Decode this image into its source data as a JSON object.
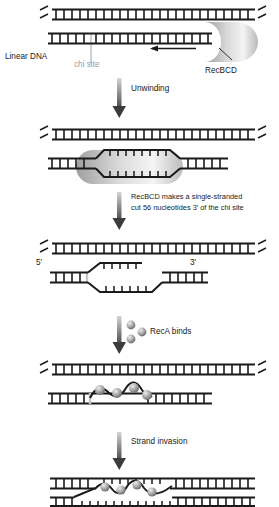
{
  "figure": {
    "background": "#ffffff",
    "width": 279,
    "height": 507
  },
  "colors": {
    "dna_stroke": "#1a1a1a",
    "chi_marker": "#b0b0b0",
    "label_text": "#1a1a1a",
    "label_text_gray": "#9a9a9a",
    "arrow": "#5a5a5a",
    "protein_fill_light": "#f2f2f2",
    "protein_fill_dark": "#8f8f8f",
    "reca_fill": "#9d9d9d"
  },
  "labels": {
    "linear_dna": "Linear DNA",
    "chi_site": "chi site",
    "recbcd": "RecBCD",
    "unwinding": "Unwinding",
    "cut_line1": "RecBCD makes a single-stranded",
    "cut_line2": "cut 56 nucleotides 3′ of the chi site",
    "five_prime": "5′",
    "three_prime": "3′",
    "reca_binds": "RecA binds",
    "strand_invasion": "Strand invasion"
  },
  "steps": [
    {
      "id": "step-1",
      "name": "linear-dna-with-recbcd",
      "caption": "Linear DNA with RecBCD bound at the right end; chi site marked; enzyme travels leftward"
    },
    {
      "id": "step-2",
      "name": "unwinding-bubble",
      "caption": "RecBCD unwinds the duplex creating a bubble of single-stranded DNA"
    },
    {
      "id": "step-3",
      "name": "single-stranded-cut",
      "caption": "Single-stranded cut made 56 nucleotides 3′ of the chi site; 5′ and 3′ ends indicated"
    },
    {
      "id": "step-4",
      "name": "reca-bound-filament",
      "caption": "RecA protein binds the single-stranded region forming a nucleoprotein filament"
    },
    {
      "id": "step-5",
      "name": "strand-invasion",
      "caption": "RecA filament invades the homologous duplex"
    }
  ],
  "transitions": [
    {
      "id": "arrow-1",
      "name": "unwinding-arrow",
      "label": "Unwinding"
    },
    {
      "id": "arrow-2",
      "name": "cut-arrow",
      "label": "RecBCD makes a single-stranded cut 56 nucleotides 3′ of the chi site"
    },
    {
      "id": "arrow-3",
      "name": "reca-binds-arrow",
      "label": "RecA binds"
    },
    {
      "id": "arrow-4",
      "name": "strand-invasion-arrow",
      "label": "Strand invasion"
    }
  ],
  "reca_particles": {
    "count_in_arrow_annotation": 3,
    "count_on_filament_step4": 4,
    "count_on_filament_step5": 4
  }
}
